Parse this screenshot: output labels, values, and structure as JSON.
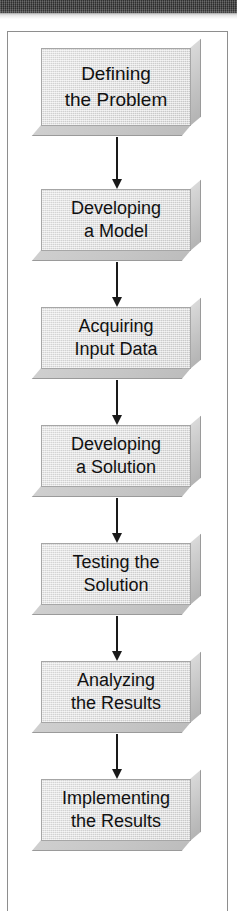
{
  "figure": {
    "type": "flowchart",
    "orientation": "vertical-top-down",
    "scan_bar_color": "#333333",
    "frame_border_color": "#8e8e8e",
    "node_fill_color": "#dcdcdc",
    "node_border_color": "#a6a6a6",
    "node_shadow_color": "#c2c2c2",
    "arrow_color": "#1a1a1a",
    "nodes": [
      {
        "id": "defining-the-problem",
        "line1": "Defining",
        "line2": "the Problem",
        "style": "tall"
      },
      {
        "id": "developing-a-model",
        "line1": "Developing",
        "line2": "a Model",
        "style": "std"
      },
      {
        "id": "acquiring-input-data",
        "line1": "Acquiring",
        "line2": "Input Data",
        "style": "std"
      },
      {
        "id": "developing-a-solution",
        "line1": "Developing",
        "line2": "a Solution",
        "style": "std"
      },
      {
        "id": "testing-the-solution",
        "line1": "Testing the",
        "line2": "Solution",
        "style": "std"
      },
      {
        "id": "analyzing-the-results",
        "line1": "Analyzing",
        "line2": "the Results",
        "style": "std"
      },
      {
        "id": "implementing-the-results",
        "line1": "Implementing",
        "line2": "the Results",
        "style": "std"
      }
    ],
    "edges": [
      {
        "from": "defining-the-problem",
        "to": "developing-a-model"
      },
      {
        "from": "developing-a-model",
        "to": "acquiring-input-data"
      },
      {
        "from": "acquiring-input-data",
        "to": "developing-a-solution"
      },
      {
        "from": "developing-a-solution",
        "to": "testing-the-solution"
      },
      {
        "from": "testing-the-solution",
        "to": "analyzing-the-results"
      },
      {
        "from": "analyzing-the-results",
        "to": "implementing-the-results"
      }
    ]
  }
}
